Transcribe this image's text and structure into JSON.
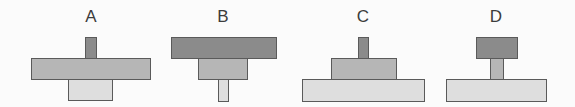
{
  "figures": [
    {
      "label": "A",
      "label_x": 76,
      "shapes": [
        {
          "role": "top-stem",
          "shade": "dark",
          "x": 85,
          "y": 37,
          "w": 12,
          "h": 22
        },
        {
          "role": "middle-bar",
          "shade": "medium",
          "x": 31,
          "y": 58,
          "w": 120,
          "h": 22
        },
        {
          "role": "bottom-block",
          "shade": "light",
          "x": 68,
          "y": 79,
          "w": 45,
          "h": 22
        }
      ]
    },
    {
      "label": "B",
      "label_x": 208,
      "shapes": [
        {
          "role": "top-bar",
          "shade": "dark",
          "x": 171,
          "y": 37,
          "w": 106,
          "h": 22
        },
        {
          "role": "middle-block",
          "shade": "medium",
          "x": 198,
          "y": 58,
          "w": 50,
          "h": 22
        },
        {
          "role": "bottom-stem",
          "shade": "light",
          "x": 218,
          "y": 79,
          "w": 11,
          "h": 23
        }
      ]
    },
    {
      "label": "C",
      "label_x": 348,
      "shapes": [
        {
          "role": "top-stem",
          "shade": "dark",
          "x": 358,
          "y": 37,
          "w": 11,
          "h": 22
        },
        {
          "role": "middle-block",
          "shade": "medium",
          "x": 331,
          "y": 58,
          "w": 66,
          "h": 22
        },
        {
          "role": "bottom-base",
          "shade": "light",
          "x": 302,
          "y": 79,
          "w": 123,
          "h": 23
        }
      ]
    },
    {
      "label": "D",
      "label_x": 481,
      "shapes": [
        {
          "role": "top-block",
          "shade": "dark",
          "x": 476,
          "y": 37,
          "w": 42,
          "h": 22
        },
        {
          "role": "middle-stem",
          "shade": "medium",
          "x": 490,
          "y": 58,
          "w": 14,
          "h": 22
        },
        {
          "role": "bottom-base",
          "shade": "light",
          "x": 446,
          "y": 79,
          "w": 101,
          "h": 23
        }
      ]
    }
  ],
  "colors": {
    "dark": "#8b8b8b",
    "medium": "#b6b6b6",
    "light": "#dedede",
    "border": "#5a5a5a",
    "label": "#3c3c3c"
  }
}
